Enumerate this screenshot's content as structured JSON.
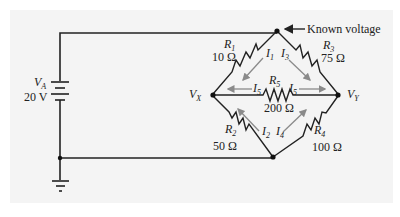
{
  "circuit": {
    "source": {
      "name": "V",
      "subscript": "A",
      "value": "20 V"
    },
    "annotation": "Known voltage",
    "nodes": {
      "left": {
        "name": "V",
        "subscript": "X"
      },
      "right": {
        "name": "V",
        "subscript": "Y"
      }
    },
    "resistors": [
      {
        "name": "R",
        "subscript": "1",
        "value": "10 Ω"
      },
      {
        "name": "R",
        "subscript": "2",
        "value": "50 Ω"
      },
      {
        "name": "R",
        "subscript": "3",
        "value": "75 Ω"
      },
      {
        "name": "R",
        "subscript": "4",
        "value": "100 Ω"
      },
      {
        "name": "R",
        "subscript": "5",
        "value": "200 Ω"
      }
    ],
    "currents": [
      {
        "name": "I",
        "subscript": "1"
      },
      {
        "name": "I",
        "subscript": "2"
      },
      {
        "name": "I",
        "subscript": "3"
      },
      {
        "name": "I",
        "subscript": "4"
      },
      {
        "name": "I",
        "subscript": "5"
      }
    ],
    "colors": {
      "wire": "#222222",
      "arrow": "#8a8a8a",
      "background": "#f4f4f4"
    }
  }
}
